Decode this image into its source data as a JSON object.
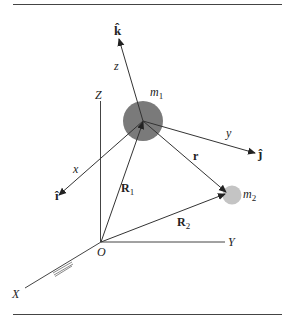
{
  "figure": {
    "type": "two-body coordinate diagram",
    "colors": {
      "line": "#333333",
      "m1_fill": "#7a7a7a",
      "m2_fill": "#c4c4c4",
      "rule": "#444444",
      "hatch": "#8a8a8a"
    },
    "labels": {
      "k_hat": "k̂",
      "j_hat": "ĵ",
      "i_hat": "î",
      "z": "z",
      "y": "y",
      "x": "x",
      "Z": "Z",
      "Y": "Y",
      "X": "X",
      "O": "O",
      "m1": "m",
      "m1_sub": "1",
      "m2": "m",
      "m2_sub": "2",
      "r": "r",
      "R1": "R",
      "R1_sub": "1",
      "R2": "R",
      "R2_sub": "2"
    }
  }
}
